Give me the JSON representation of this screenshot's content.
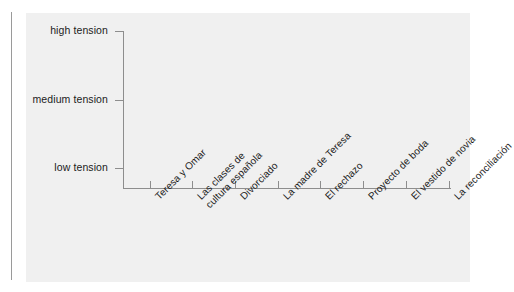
{
  "chart_data": {
    "type": "line",
    "title": "",
    "subtitle": "",
    "xlabel": "",
    "ylabel": "",
    "grid": false,
    "legend": null,
    "legend_position": "none",
    "annotations": [],
    "note": "Blank tension graph template — axes and tick labels only, no data plotted.",
    "categories": [
      "Teresa y Omar",
      "Las clases de\ncultura española",
      "Divorciado",
      "La madre de Teresa",
      "El rechazo",
      "Proyecto de boda",
      "El vestido de novia",
      "La reconciliación"
    ],
    "y_tick_labels": [
      "high tension",
      "medium tension",
      "low tension"
    ],
    "ylim": [
      0,
      3
    ],
    "series": [
      {
        "name": "tension",
        "values": [
          null,
          null,
          null,
          null,
          null,
          null,
          null,
          null
        ]
      }
    ]
  },
  "axes": {
    "y_ticks": [
      {
        "label": "high tension",
        "top": 18
      },
      {
        "label": "medium tension",
        "top": 87
      },
      {
        "label": "low tension",
        "top": 155
      }
    ],
    "x_ticks": [
      {
        "label": "Teresa y Omar",
        "left": 124,
        "lines": [
          "Teresa y Omar"
        ]
      },
      {
        "label": "Las clases de cultura española",
        "left": 166,
        "lines": [
          "Las clases de",
          "cultura española"
        ]
      },
      {
        "label": "Divorciado",
        "left": 209,
        "lines": [
          "Divorciado"
        ]
      },
      {
        "label": "La madre de Teresa",
        "left": 252,
        "lines": [
          "La madre de Teresa"
        ]
      },
      {
        "label": "El rechazo",
        "left": 294,
        "lines": [
          "El rechazo"
        ]
      },
      {
        "label": "Proyecto de boda",
        "left": 337,
        "lines": [
          "Proyecto de boda"
        ]
      },
      {
        "label": "El vestido de novia",
        "left": 380,
        "lines": [
          "El vestido de novia"
        ]
      },
      {
        "label": "La reconciliación",
        "left": 423,
        "lines": [
          "La reconciliación"
        ]
      }
    ]
  },
  "colors": {
    "page_background": "#ffffff",
    "panel_background": "#f0f0f0",
    "axis": "#8d8d8d",
    "text": "#1b1b1b",
    "page_rule": "#9a9a9a"
  }
}
